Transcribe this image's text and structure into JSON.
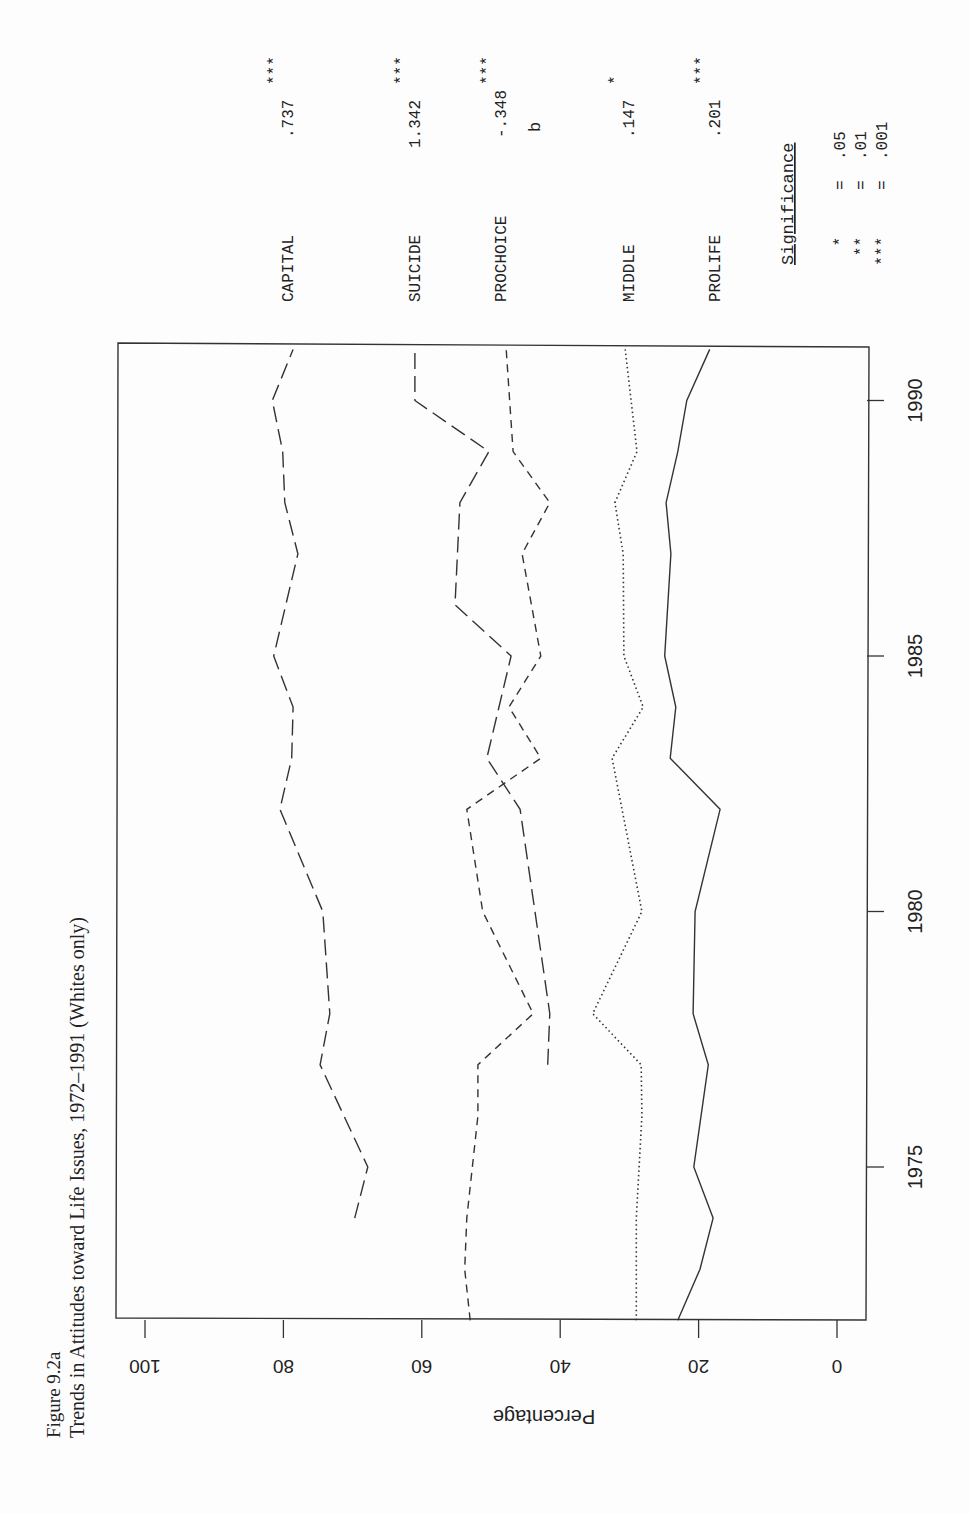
{
  "figure": {
    "label": "Figure 9.2a",
    "title": "Trends in Attitudes toward Life Issues, 1972–1991 (Whites only)"
  },
  "axes": {
    "y_label": "Percentage",
    "y_ticks": [
      "0",
      "20",
      "40",
      "60",
      "80",
      "100"
    ],
    "x_ticks": [
      "1975",
      "1980",
      "1985",
      "1990"
    ]
  },
  "legend": {
    "header": "b",
    "items": [
      {
        "name": "CAPITAL",
        "b": ".737",
        "sig": "***",
        "style": "long-dash"
      },
      {
        "name": "SUICIDE",
        "b": "1.342",
        "sig": "***",
        "style": "long-dash"
      },
      {
        "name": "PROCHOICE",
        "b": "-.348",
        "sig": "***",
        "style": "dash"
      },
      {
        "name": "MIDDLE",
        "b": ".147",
        "sig": "*",
        "style": "dot"
      },
      {
        "name": "PROLIFE",
        "b": ".201",
        "sig": "***",
        "style": "solid"
      }
    ],
    "significance_title": "Significance",
    "significance": [
      {
        "stars": "*",
        "eq": "=",
        "p": ".05"
      },
      {
        "stars": "**",
        "eq": "=",
        "p": ".01"
      },
      {
        "stars": "***",
        "eq": "=",
        "p": ".001"
      }
    ]
  },
  "chart_data": {
    "type": "line",
    "title": "Trends in Attitudes toward Life Issues, 1972–1991 (Whites only)",
    "xlabel": "Year",
    "ylabel": "Percentage",
    "xlim": [
      1972,
      1991
    ],
    "ylim": [
      0,
      100
    ],
    "orientation": "rotated 90° (year axis vertical, percentage axis horizontal)",
    "grid": false,
    "legend_position": "right (top of rotated page)",
    "series": [
      {
        "name": "CAPITAL",
        "b": 0.737,
        "significance": "***",
        "x": [
          1974,
          1975,
          1977,
          1978,
          1980,
          1982,
          1983,
          1984,
          1985,
          1987,
          1988,
          1989,
          1990,
          1991
        ],
        "values": [
          69.7,
          67.8,
          74.7,
          73.3,
          74.3,
          80.5,
          78.8,
          78.6,
          81.4,
          77.9,
          79.8,
          80.1,
          81.6,
          78.6
        ]
      },
      {
        "name": "SUICIDE",
        "b": 1.342,
        "significance": "***",
        "x": [
          1977,
          1978,
          1982,
          1983,
          1985,
          1986,
          1988,
          1989,
          1990,
          1991
        ],
        "values": [
          41.8,
          41.5,
          45.8,
          50.6,
          47.1,
          55.2,
          54.5,
          50.3,
          61.0,
          61.0
        ]
      },
      {
        "name": "PROCHOICE",
        "b": -0.348,
        "significance": "***",
        "x": [
          1972,
          1973,
          1974,
          1976,
          1977,
          1978,
          1980,
          1982,
          1983,
          1984,
          1985,
          1987,
          1988,
          1989,
          1991
        ],
        "values": [
          53.0,
          53.8,
          53.5,
          51.9,
          51.9,
          43.9,
          51.2,
          53.5,
          42.8,
          47.4,
          42.8,
          45.5,
          41.5,
          46.8,
          47.8
        ]
      },
      {
        "name": "MIDDLE",
        "b": 0.147,
        "significance": "*",
        "x": [
          1972,
          1974,
          1976,
          1977,
          1978,
          1980,
          1983,
          1984,
          1985,
          1987,
          1988,
          1989,
          1991
        ],
        "values": [
          29.0,
          29.0,
          28.2,
          28.3,
          35.3,
          28.2,
          32.5,
          28.0,
          30.8,
          30.9,
          32.1,
          28.9,
          30.6
        ]
      },
      {
        "name": "PROLIFE",
        "b": 0.201,
        "significance": "***",
        "x": [
          1972,
          1973,
          1974,
          1975,
          1977,
          1978,
          1980,
          1982,
          1983,
          1984,
          1985,
          1987,
          1988,
          1989,
          1990,
          1991
        ],
        "values": [
          23.0,
          19.8,
          17.9,
          20.7,
          18.6,
          20.8,
          20.5,
          16.9,
          24.1,
          23.3,
          24.9,
          24.0,
          24.7,
          23.0,
          21.7,
          18.4
        ]
      }
    ]
  }
}
